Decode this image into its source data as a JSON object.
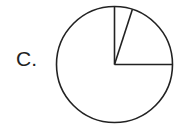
{
  "label": "C.",
  "chart_data": {
    "type": "pie",
    "title": "",
    "categories": [
      "Slice A",
      "Slice B",
      "Slice C"
    ],
    "values": [
      5,
      20,
      75
    ],
    "start_angle_deg": 90,
    "direction": "clockwise",
    "fill": "none",
    "stroke": "#222222",
    "labels_shown": false
  },
  "geometry": {
    "cx": 114.5,
    "cy": 64.5,
    "r": 58
  }
}
